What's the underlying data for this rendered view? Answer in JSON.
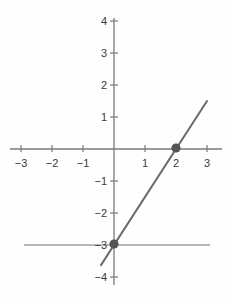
{
  "chart_data": {
    "type": "line",
    "title": "",
    "xlabel": "",
    "ylabel": "",
    "xlim": [
      -3.45,
      3.35
    ],
    "ylim": [
      -4.2,
      4.1
    ],
    "grid": false,
    "legend": null,
    "x_ticks": [
      -3,
      -2,
      -1,
      1,
      2,
      3
    ],
    "x_tick_labels": [
      "−3",
      "−2",
      "−1",
      "1",
      "2",
      "3"
    ],
    "y_ticks": [
      4,
      3,
      2,
      1,
      -1,
      -2,
      -3,
      -4
    ],
    "y_tick_labels": [
      "4",
      "3",
      "2",
      "1",
      "−1",
      "−2",
      "−3",
      "−4"
    ],
    "series": [
      {
        "name": "line",
        "kind": "line",
        "equation": "y = 1.5x - 3",
        "slope": 1.5,
        "intercept": -3,
        "color": "#6b6b6b",
        "x_start": -0.42,
        "y_start": -3.63,
        "x_end": 3.0,
        "y_end": 1.5
      },
      {
        "name": "horizontal-line",
        "kind": "line",
        "equation": "y = -3",
        "slope": 0,
        "intercept": -3,
        "color": "#b8b8b8",
        "x_start": -2.9,
        "y_start": -3,
        "x_end": 3.1,
        "y_end": -3
      }
    ],
    "points": [
      {
        "name": "x-intercept",
        "x": 2,
        "y": 0,
        "color": "#555555"
      },
      {
        "name": "intersection",
        "x": 0,
        "y": -3,
        "color": "#555555"
      }
    ],
    "axis_color": "#777777",
    "background": "#fefefe"
  }
}
